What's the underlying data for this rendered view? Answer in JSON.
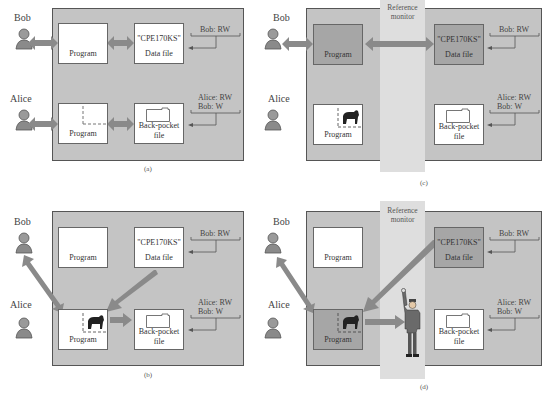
{
  "people": {
    "bob": "Bob",
    "alice": "Alice"
  },
  "boxes": {
    "program": "Program",
    "data_file_name": "\"CPE170KS\"",
    "data_file_label": "Data file",
    "back_pocket_line1": "Back-pocket",
    "back_pocket_line2": "file"
  },
  "acl": {
    "data_file": "Bob: RW",
    "back_pocket_line1": "Alice: RW",
    "back_pocket_line2": "Bob: W"
  },
  "reference_monitor": {
    "line1": "Reference",
    "line2": "monitor"
  },
  "captions": {
    "a": "(a)",
    "b": "(b)",
    "c": "(c)",
    "d": "(d)"
  },
  "colors": {
    "panel": "#c4c4c4",
    "band": "#dedede",
    "highlight_box": "#a6a6a6",
    "arrow": "#8a8a8a"
  }
}
